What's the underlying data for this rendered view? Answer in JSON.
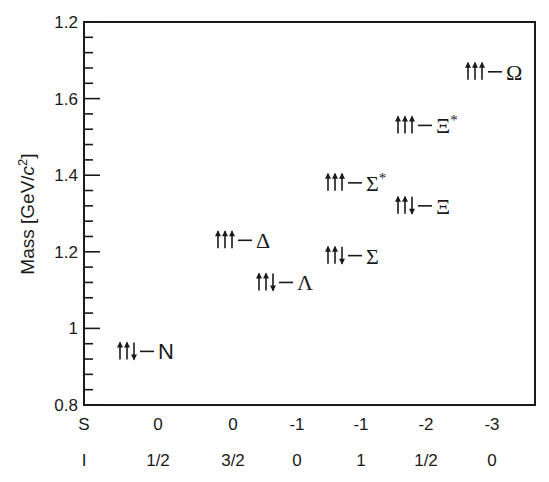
{
  "chart_data": {
    "type": "scatter",
    "title": "",
    "xlabel": "",
    "ylabel": "Mass  [GeV/c²]",
    "ylabel_parts": {
      "main": "Mass",
      "unit_open": "[GeV/",
      "unit_c": "c",
      "unit_exp": "2",
      "unit_close": "]"
    },
    "ylim": [
      0.8,
      1.8
    ],
    "y_ticks": [
      {
        "value": 0.8,
        "label": "0.8"
      },
      {
        "value": 1.0,
        "label": "1"
      },
      {
        "value": 1.2,
        "label": "1.2"
      },
      {
        "value": 1.4,
        "label": "1.4"
      },
      {
        "value": 1.6,
        "label": "1.6"
      },
      {
        "value": 1.8,
        "label": "1.2"
      }
    ],
    "minor_tick_step": 0.04,
    "grid": false,
    "row_labels": {
      "S": "S",
      "I": "I"
    },
    "columns": [
      {
        "S": "0",
        "I": "1/2"
      },
      {
        "S": "0",
        "I": "3/2"
      },
      {
        "S": "-1",
        "I": "0"
      },
      {
        "S": "-1",
        "I": "1"
      },
      {
        "S": "-2",
        "I": "1/2"
      },
      {
        "S": "-3",
        "I": "0"
      }
    ],
    "points": [
      {
        "name": "N",
        "symbol": "N",
        "spins": "↑↑↓",
        "mass": 0.94,
        "column": 0
      },
      {
        "name": "Delta",
        "symbol": "Δ",
        "spins": "↑↑↑",
        "mass": 1.23,
        "column": 1
      },
      {
        "name": "Lambda",
        "symbol": "Λ",
        "spins": "↑↑↓",
        "mass": 1.12,
        "column": 2
      },
      {
        "name": "Sigma",
        "symbol": "Σ",
        "spins": "↑↑↓",
        "mass": 1.19,
        "column": 3
      },
      {
        "name": "Sigma*",
        "symbol": "Σ*",
        "spins": "↑↑↑",
        "mass": 1.38,
        "column": 3
      },
      {
        "name": "Xi",
        "symbol": "Ξ",
        "spins": "↑↑↓",
        "mass": 1.32,
        "column": 4
      },
      {
        "name": "Xi*",
        "symbol": "Ξ*",
        "spins": "↑↑↑",
        "mass": 1.53,
        "column": 4
      },
      {
        "name": "Omega",
        "symbol": "Ω",
        "spins": "↑↑↑",
        "mass": 1.67,
        "column": 5
      }
    ]
  },
  "colors": {
    "ink": "#1a1a1a",
    "background": "#ffffff"
  }
}
